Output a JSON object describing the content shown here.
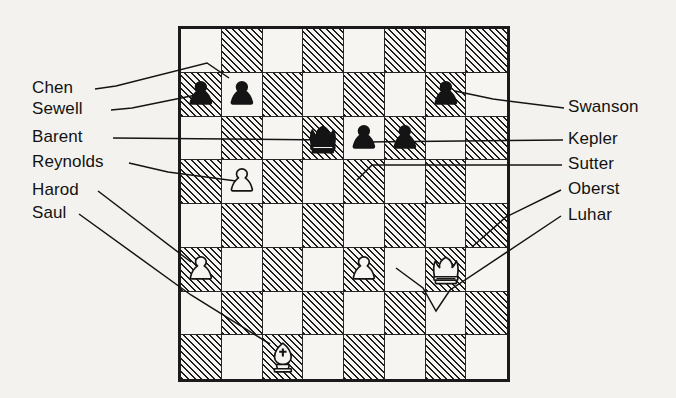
{
  "diagram": {
    "type": "chess-board-diagram",
    "board": {
      "rows": 8,
      "columns": 8,
      "light_square_color": "#f7f5f1",
      "dark_square_color": "#1d1d1d",
      "dark_square_fill": "diagonal-hatch",
      "border_color": "#1a1a1a",
      "squares": [
        [
          "light",
          "dark",
          "light",
          "dark",
          "light",
          "dark",
          "light",
          "dark"
        ],
        [
          "dark",
          "light",
          "dark",
          "light",
          "dark",
          "light",
          "dark",
          "light"
        ],
        [
          "light",
          "dark",
          "light",
          "dark",
          "light",
          "dark",
          "light",
          "dark"
        ],
        [
          "dark",
          "light",
          "dark",
          "light",
          "dark",
          "light",
          "dark",
          "light"
        ],
        [
          "light",
          "dark",
          "light",
          "dark",
          "light",
          "dark",
          "light",
          "dark"
        ],
        [
          "dark",
          "light",
          "dark",
          "light",
          "dark",
          "light",
          "dark",
          "light"
        ],
        [
          "light",
          "dark",
          "light",
          "dark",
          "light",
          "dark",
          "light",
          "dark"
        ],
        [
          "dark",
          "light",
          "dark",
          "light",
          "dark",
          "light",
          "dark",
          "light"
        ]
      ],
      "pieces": [
        {
          "row": 1,
          "col": 0,
          "piece": "pawn",
          "color": "black",
          "label": "Sewell"
        },
        {
          "row": 1,
          "col": 1,
          "piece": "pawn",
          "color": "black",
          "label": "Chen"
        },
        {
          "row": 1,
          "col": 6,
          "piece": "pawn",
          "color": "black",
          "label": "Swanson"
        },
        {
          "row": 2,
          "col": 3,
          "piece": "king",
          "color": "black",
          "label": "Barent"
        },
        {
          "row": 2,
          "col": 4,
          "piece": "pawn",
          "color": "black",
          "label": "Kepler"
        },
        {
          "row": 2,
          "col": 5,
          "piece": "pawn",
          "color": "black",
          "label": "Sutter"
        },
        {
          "row": 3,
          "col": 1,
          "piece": "pawn",
          "color": "white",
          "label": "Reynolds"
        },
        {
          "row": 5,
          "col": 0,
          "piece": "pawn",
          "color": "white",
          "label": "Harod"
        },
        {
          "row": 5,
          "col": 4,
          "piece": "pawn",
          "color": "white",
          "label": "Luhar"
        },
        {
          "row": 5,
          "col": 6,
          "piece": "king",
          "color": "white",
          "label": "Oberst"
        },
        {
          "row": 7,
          "col": 2,
          "piece": "bishop",
          "color": "white",
          "label": "Saul"
        }
      ]
    },
    "labels": {
      "left": [
        {
          "name": "Chen"
        },
        {
          "name": "Sewell"
        },
        {
          "name": "Barent"
        },
        {
          "name": "Reynolds"
        },
        {
          "name": "Harod"
        },
        {
          "name": "Saul"
        }
      ],
      "right": [
        {
          "name": "Swanson"
        },
        {
          "name": "Kepler"
        },
        {
          "name": "Sutter"
        },
        {
          "name": "Oberst"
        },
        {
          "name": "Luhar"
        }
      ]
    }
  }
}
